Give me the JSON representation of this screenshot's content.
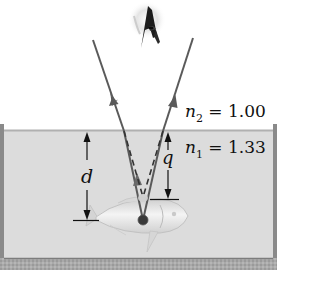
{
  "figure": {
    "colors": {
      "background": "#ffffff",
      "water": "#dcdcdc",
      "water_surface": "#b4b4b4",
      "container_wall": "#8c8c8c",
      "container_floor": "#a8a8a8",
      "ray": "#5a5a5a",
      "dashed_ray": "#333333",
      "dimension_line": "#111111",
      "fish_body": "#e8e8e8",
      "fish_outline": "#c4c4c4",
      "object_dot": "#3a3a3a",
      "text": "#111111"
    },
    "labels": {
      "n2_symbol": "n",
      "n2_sub": "2",
      "n2_value": " = 1.00",
      "n1_symbol": "n",
      "n1_sub": "1",
      "n1_value": " = 1.33",
      "d": "d",
      "q": "q"
    },
    "elements": {
      "observer_eye": "eye-icon",
      "fish": "fish-icon",
      "object_point": "dot",
      "left_ray": "ray-with-arrow",
      "right_ray": "ray-with-arrow",
      "virtual_rays": "dashed-lines",
      "real_depth": "double-arrow-d",
      "apparent_depth": "double-arrow-q"
    }
  }
}
